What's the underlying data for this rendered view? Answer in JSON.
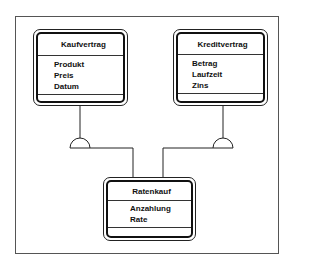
{
  "diagram": {
    "type": "class-diagram",
    "entities": [
      {
        "id": "kaufvertrag",
        "title": "Kaufvertrag",
        "attributes": [
          "Produkt",
          "Preis",
          "Datum"
        ]
      },
      {
        "id": "kreditvertrag",
        "title": "Kreditvertrag",
        "attributes": [
          "Betrag",
          "Laufzeit",
          "Zins"
        ]
      },
      {
        "id": "ratenkauf",
        "title": "Ratenkauf",
        "attributes": [
          "Anzahlung",
          "Rate"
        ]
      }
    ],
    "relations": [
      {
        "from": "ratenkauf",
        "to": "kaufvertrag",
        "kind": "generalization-semicircle"
      },
      {
        "from": "ratenkauf",
        "to": "kreditvertrag",
        "kind": "generalization-semicircle"
      }
    ],
    "colors": {
      "line": "#222222",
      "frame": "#555555",
      "background": "#ffffff"
    }
  }
}
